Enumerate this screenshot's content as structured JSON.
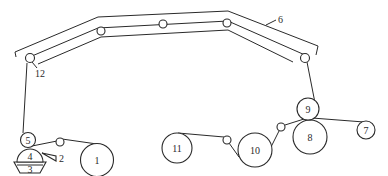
{
  "diagram": {
    "type": "process-schematic",
    "labels": {
      "l1": "1",
      "l2": "2",
      "l3": "3",
      "l4": "4",
      "l5": "5",
      "l6": "6",
      "l7": "7",
      "l8": "8",
      "l9": "9",
      "l10": "10",
      "l11": "11",
      "l12": "12"
    },
    "components": [
      {
        "id": "1",
        "shape": "large-roll"
      },
      {
        "id": "2",
        "shape": "wedge"
      },
      {
        "id": "3",
        "shape": "trough"
      },
      {
        "id": "4",
        "shape": "half-roller"
      },
      {
        "id": "5",
        "shape": "roller"
      },
      {
        "id": "6",
        "shape": "overhead-conveyor"
      },
      {
        "id": "7",
        "shape": "small-roll"
      },
      {
        "id": "8",
        "shape": "large-roller"
      },
      {
        "id": "9",
        "shape": "roller"
      },
      {
        "id": "10",
        "shape": "large-roll"
      },
      {
        "id": "11",
        "shape": "large-roll"
      },
      {
        "id": "12",
        "shape": "guide-roller"
      }
    ]
  }
}
